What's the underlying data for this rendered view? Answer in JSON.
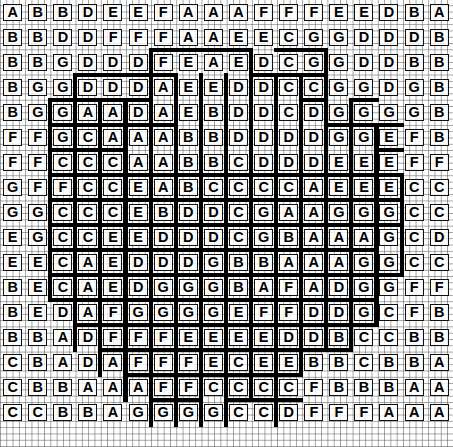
{
  "figure": {
    "type": "letter-grid-region-map",
    "columns": 18,
    "rows": 17,
    "cell_width_px": 25,
    "cell_height_px": 25,
    "colors": {
      "ink": "#000000",
      "paper": "#ffffff",
      "grid_line": "#505050",
      "boundary": "#000000"
    },
    "alphabet": [
      "A",
      "B",
      "C",
      "D",
      "E",
      "F",
      "G"
    ]
  },
  "grid": {
    "rows": [
      [
        "A",
        "B",
        "B",
        "D",
        "E",
        "E",
        "F",
        "A",
        "A",
        "A",
        "F",
        "F",
        "F",
        "E",
        "E",
        "D",
        "B",
        "A"
      ],
      [
        "B",
        "B",
        "D",
        "D",
        "F",
        "F",
        "F",
        "A",
        "A",
        "E",
        "E",
        "C",
        "G",
        "G",
        "D",
        "D",
        "D",
        "B"
      ],
      [
        "B",
        "B",
        "G",
        "D",
        "D",
        "D",
        "F",
        "E",
        "A",
        "E",
        "D",
        "C",
        "G",
        "G",
        "D",
        "D",
        "B",
        "B"
      ],
      [
        "B",
        "G",
        "G",
        "D",
        "D",
        "D",
        "A",
        "E",
        "E",
        "D",
        "D",
        "C",
        "C",
        "G",
        "G",
        "D",
        "G",
        "B"
      ],
      [
        "B",
        "G",
        "G",
        "A",
        "A",
        "D",
        "A",
        "E",
        "B",
        "D",
        "D",
        "C",
        "D",
        "G",
        "G",
        "G",
        "G",
        "B"
      ],
      [
        "F",
        "F",
        "G",
        "C",
        "A",
        "A",
        "A",
        "B",
        "B",
        "D",
        "D",
        "D",
        "D",
        "G",
        "G",
        "E",
        "F",
        "B"
      ],
      [
        "F",
        "F",
        "C",
        "C",
        "C",
        "A",
        "A",
        "B",
        "B",
        "C",
        "D",
        "D",
        "D",
        "E",
        "E",
        "E",
        "F",
        "F"
      ],
      [
        "G",
        "F",
        "F",
        "C",
        "C",
        "E",
        "A",
        "B",
        "C",
        "C",
        "C",
        "C",
        "A",
        "E",
        "E",
        "E",
        "C",
        "C"
      ],
      [
        "G",
        "G",
        "C",
        "C",
        "C",
        "E",
        "B",
        "D",
        "D",
        "C",
        "G",
        "A",
        "A",
        "G",
        "G",
        "G",
        "C",
        "C"
      ],
      [
        "E",
        "G",
        "C",
        "C",
        "E",
        "E",
        "D",
        "D",
        "D",
        "C",
        "G",
        "B",
        "A",
        "A",
        "A",
        "G",
        "C",
        "D"
      ],
      [
        "E",
        "E",
        "C",
        "A",
        "E",
        "D",
        "D",
        "D",
        "G",
        "B",
        "B",
        "A",
        "A",
        "A",
        "G",
        "G",
        "C",
        "C"
      ],
      [
        "B",
        "E",
        "C",
        "A",
        "E",
        "D",
        "G",
        "G",
        "G",
        "B",
        "A",
        "F",
        "A",
        "D",
        "G",
        "G",
        "F",
        "F"
      ],
      [
        "B",
        "E",
        "D",
        "A",
        "F",
        "G",
        "G",
        "G",
        "G",
        "E",
        "F",
        "F",
        "D",
        "D",
        "G",
        "C",
        "F",
        "B"
      ],
      [
        "B",
        "B",
        "A",
        "D",
        "F",
        "F",
        "F",
        "E",
        "E",
        "E",
        "E",
        "D",
        "D",
        "B",
        "C",
        "C",
        "B",
        "B"
      ],
      [
        "C",
        "B",
        "A",
        "D",
        "A",
        "F",
        "F",
        "F",
        "E",
        "C",
        "E",
        "E",
        "B",
        "B",
        "C",
        "B",
        "B",
        "A"
      ],
      [
        "C",
        "B",
        "B",
        "A",
        "A",
        "A",
        "F",
        "F",
        "C",
        "C",
        "C",
        "C",
        "F",
        "B",
        "B",
        "B",
        "A",
        "A"
      ],
      [
        "C",
        "C",
        "B",
        "B",
        "A",
        "G",
        "G",
        "G",
        "G",
        "C",
        "C",
        "D",
        "F",
        "F",
        "F",
        "A",
        "A",
        "A"
      ]
    ]
  },
  "region": {
    "name": "bold-bounded-region",
    "description": "Thick black boundary tracing an irregular blob across the middle of the grid",
    "horizontal_segments": [
      {
        "row": 2,
        "col_start": 6,
        "col_end": 10
      },
      {
        "row": 2,
        "col_start": 11,
        "col_end": 13
      },
      {
        "row": 3,
        "col_start": 3,
        "col_end": 6
      },
      {
        "row": 3,
        "col_start": 10,
        "col_end": 13
      },
      {
        "row": 4,
        "col_start": 2,
        "col_end": 3
      },
      {
        "row": 4,
        "col_start": 12,
        "col_end": 13
      },
      {
        "row": 4,
        "col_start": 14,
        "col_end": 15
      },
      {
        "row": 5,
        "col_start": 2,
        "col_end": 3
      },
      {
        "row": 5,
        "col_start": 13,
        "col_end": 16
      },
      {
        "row": 6,
        "col_start": 2,
        "col_end": 3
      },
      {
        "row": 6,
        "col_start": 15,
        "col_end": 16
      },
      {
        "row": 7,
        "col_start": 2,
        "col_end": 16
      },
      {
        "row": 8,
        "col_start": 2,
        "col_end": 3
      },
      {
        "row": 9,
        "col_start": 2,
        "col_end": 16
      },
      {
        "row": 10,
        "col_start": 2,
        "col_end": 3
      },
      {
        "row": 11,
        "col_start": 2,
        "col_end": 3
      },
      {
        "row": 11,
        "col_start": 15,
        "col_end": 16
      },
      {
        "row": 12,
        "col_start": 2,
        "col_end": 15
      },
      {
        "row": 13,
        "col_start": 3,
        "col_end": 4
      },
      {
        "row": 13,
        "col_start": 14,
        "col_end": 15
      },
      {
        "row": 14,
        "col_start": 4,
        "col_end": 5
      },
      {
        "row": 14,
        "col_start": 12,
        "col_end": 14
      },
      {
        "row": 15,
        "col_start": 5,
        "col_end": 12
      },
      {
        "row": 16,
        "col_start": 6,
        "col_end": 8
      },
      {
        "row": 16,
        "col_start": 9,
        "col_end": 12
      }
    ],
    "vertical_segments": [
      {
        "col": 2,
        "row_start": 4,
        "row_end": 12
      },
      {
        "col": 3,
        "row_start": 3,
        "row_end": 4
      },
      {
        "col": 3,
        "row_start": 12,
        "row_end": 14
      },
      {
        "col": 4,
        "row_start": 13,
        "row_end": 15
      },
      {
        "col": 5,
        "row_start": 14,
        "row_end": 16
      },
      {
        "col": 6,
        "row_start": 2,
        "row_end": 3
      },
      {
        "col": 6,
        "row_start": 15,
        "row_end": 17
      },
      {
        "col": 7,
        "row_start": 16,
        "row_end": 17
      },
      {
        "col": 8,
        "row_start": 16,
        "row_end": 17
      },
      {
        "col": 9,
        "row_start": 16,
        "row_end": 17
      },
      {
        "col": 10,
        "row_start": 2,
        "row_end": 3
      },
      {
        "col": 11,
        "row_start": 15,
        "row_end": 17
      },
      {
        "col": 12,
        "row_start": 14,
        "row_end": 15
      },
      {
        "col": 13,
        "row_start": 2,
        "row_end": 5
      },
      {
        "col": 14,
        "row_start": 4,
        "row_end": 5
      },
      {
        "col": 14,
        "row_start": 13,
        "row_end": 14
      },
      {
        "col": 15,
        "row_start": 5,
        "row_end": 7
      },
      {
        "col": 15,
        "row_start": 11,
        "row_end": 13
      },
      {
        "col": 16,
        "row_start": 7,
        "row_end": 11
      }
    ],
    "inner_segments_h": [
      {
        "row": 3,
        "col_start": 6,
        "col_end": 7
      },
      {
        "row": 4,
        "col_start": 3,
        "col_end": 6
      },
      {
        "row": 5,
        "col_start": 3,
        "col_end": 7
      },
      {
        "row": 6,
        "col_start": 3,
        "col_end": 5
      },
      {
        "row": 8,
        "col_start": 3,
        "col_end": 16
      },
      {
        "row": 10,
        "col_start": 3,
        "col_end": 15
      },
      {
        "row": 11,
        "col_start": 3,
        "col_end": 15
      },
      {
        "row": 13,
        "col_start": 4,
        "col_end": 14
      },
      {
        "row": 14,
        "col_start": 5,
        "col_end": 12
      }
    ],
    "inner_segments_v": [
      {
        "col": 3,
        "row_start": 4,
        "row_end": 12
      },
      {
        "col": 4,
        "row_start": 4,
        "row_end": 15
      },
      {
        "col": 5,
        "row_start": 4,
        "row_end": 16
      },
      {
        "col": 6,
        "row_start": 3,
        "row_end": 16
      },
      {
        "col": 7,
        "row_start": 3,
        "row_end": 16
      },
      {
        "col": 8,
        "row_start": 3,
        "row_end": 16
      },
      {
        "col": 9,
        "row_start": 3,
        "row_end": 16
      },
      {
        "col": 10,
        "row_start": 3,
        "row_end": 16
      },
      {
        "col": 11,
        "row_start": 3,
        "row_end": 16
      },
      {
        "col": 12,
        "row_start": 3,
        "row_end": 15
      },
      {
        "col": 13,
        "row_start": 5,
        "row_end": 14
      },
      {
        "col": 14,
        "row_start": 5,
        "row_end": 13
      },
      {
        "col": 15,
        "row_start": 7,
        "row_end": 11
      }
    ]
  },
  "caption": {
    "mark": ""
  }
}
